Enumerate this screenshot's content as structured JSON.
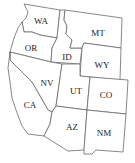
{
  "map": {
    "title": "Western United States",
    "states": [
      {
        "abbr": "WA"
      },
      {
        "abbr": "OR"
      },
      {
        "abbr": "ID"
      },
      {
        "abbr": "MT"
      },
      {
        "abbr": "WY"
      },
      {
        "abbr": "NV"
      },
      {
        "abbr": "UT"
      },
      {
        "abbr": "CO"
      },
      {
        "abbr": "CA"
      },
      {
        "abbr": "AZ"
      },
      {
        "abbr": "NM"
      }
    ],
    "colors": {
      "fill": "#ffffff",
      "border": "#6a6a6a",
      "label": "#222222"
    }
  }
}
